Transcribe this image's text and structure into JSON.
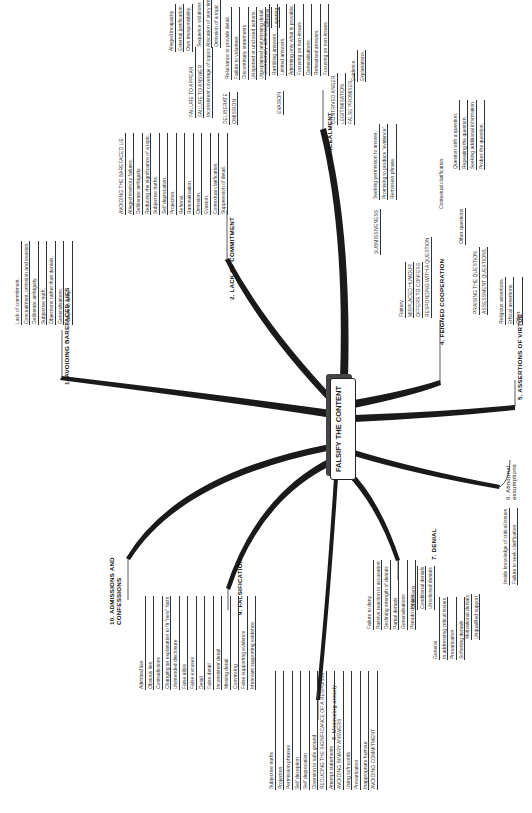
{
  "center": {
    "label": "FALSIFY THE CONTENT"
  },
  "branches": {
    "b1": {
      "title": "1.  AVOIDING BAREFACED LIES",
      "items": [
        "Lack of commitment.",
        "Concealment, omission and evasion.",
        "Deliberate ambiguity.",
        "Subjective truth.",
        "Objections rather than denials.",
        "Generalisations.",
        "Failure to deny."
      ]
    },
    "b2": {
      "title": "2.  LACK OF COMMITMENT",
      "items": [
        "AVOIDING THE BAREFACED LIE",
        "Alleged memory failures.",
        "Deliberate ambiguity.",
        "Reducing the significance of a topic.",
        "Subjective truths.",
        "Self deprecation.",
        "Projection.",
        "Referral.",
        "Rationalisation.",
        "Omission.",
        "Evasion.",
        "Contextual clarification.",
        "Suppression of detail."
      ]
    },
    "b3": {
      "title": "3.  CONCEALMENT",
      "failure_to_appear": {
        "label": "FAILURE TO APPEAR",
        "items": [
          "Alleged incapacity.",
          "External justification.",
          "Own irresponsibility."
        ]
      },
      "failure_to_answer": {
        "label": "FAILURE TO ANSWER",
        "items": [
          "Inconsistent coverage of topics",
          "Sequence violations",
          "Allocation of story time.",
          "Omission of a topic."
        ]
      },
      "omission": {
        "label": "OMISSION",
        "deliberate": "DELIBERATE",
        "items": [
          "Reluctance to provide detail.",
          "Failure to volunteer.",
          "Discontinuity statements.",
          "Unopened or unclosed actions.",
          "Unexplained and missing detail."
        ]
      },
      "evasion": {
        "label": "EVASION",
        "items": [
          "Diversionary admissions.",
          "Rambling answers",
          "General",
          "Layering",
          "Limited answers.",
          "Admitting only what is provable.",
          "Focusing on non-issues.",
          "Generalisations.",
          "Rehearsed answers.",
          "Focusing on non-issues."
        ]
      },
      "others": [
        "CONTRIVED ANGER.",
        "LEGITIMISATION.",
        "FALSE PROMISES"
      ],
      "false_promises": [
        "Evidence.",
        "Explanations."
      ]
    },
    "b4": {
      "title": "4.  FEIGNED COOPERATION",
      "submissiveness": {
        "label": "SUBMISSIVENESS",
        "items": [
          "Seeking permission to answer.",
          "Promising to produce \"evidence\".",
          "Remission phrase."
        ]
      },
      "items": [
        "Flattery.",
        "MISPLACED HUMOUR",
        "OFFERS TO CONFESS"
      ],
      "responding": {
        "label": "RESPONDING WITH A QUESTION",
        "contextual": "Contextual clarification",
        "contextual_items": [
          "Question with a question.",
          "Repeating the question.",
          "Seeking additional information.",
          "Probes the question."
        ],
        "other": "Other questions"
      },
      "more": [
        "PRAISING THE QUESTION.",
        "ASSESSMENT QUESTIONS."
      ]
    },
    "b5": {
      "title": "5.  ASSERTIONS OF VIRTUE",
      "items": [
        "Religious assertions.",
        "Ethical assertions.",
        "Other."
      ]
    },
    "b6": {
      "title": "6.  Abnormal assumptions",
      "items": [
        "Inside knowledge of critical issues",
        "Failure to seek clarification"
      ]
    },
    "b7": {
      "title": "7.  DENIAL",
      "items": [
        "Failure to deny",
        "Passive reaction to accusation",
        "Declining strength of denials",
        "Partial denials",
        "Generalisations",
        "Pseudo denials",
        "Objections",
        "Conditional denials",
        "Unsolicited denials",
        "General",
        "In addressing critical issues",
        "Prevarication",
        "Softening denials",
        "Motivational denials",
        "Unqualified support"
      ]
    },
    "b8": {
      "title": "8.  Minimizing anxiety",
      "items": [
        "Subjective truths",
        "Projection",
        "Permission phrases",
        "Self deception",
        "Self deprecation",
        "Diversion to safe ground",
        "REDUCING THE SIGNIFICANCE OF A RESPONSE",
        "Attempt statements",
        "AVOIDING BINARY ANSWERS",
        "Using soft words",
        "Prevarication",
        "Inappropriate humour",
        "AVOIDING COMMITMENT"
      ]
    },
    "b9": {
      "title": "9.  FALSIFICATION",
      "items": [
        "Admitted lies",
        "Obvious lies",
        "Contradictions",
        "Changing an explanation to fit \"new\" facts",
        "Unintended disclosure",
        "False alibis",
        "False excuses",
        "Detail",
        "False detail",
        "Inconsistent detail",
        "Missing detail",
        "Convincing",
        "False supporting evidence",
        "Irrelevant supporting evidence"
      ]
    },
    "b10": {
      "title": "10.  ADMISSIONS AND CONFESSIONS"
    }
  }
}
